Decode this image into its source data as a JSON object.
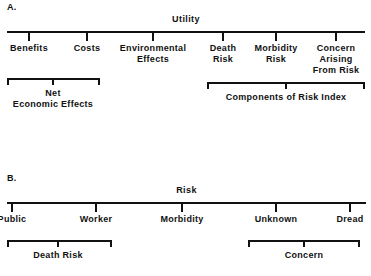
{
  "figure": {
    "background_color": "#ffffff",
    "ink_color": "#111111",
    "panels": [
      {
        "letter": "A.",
        "axis_title": "Utility",
        "axis": {
          "x1": 7,
          "x2": 365,
          "y": 31
        },
        "ticks": [
          {
            "label": "Benefits",
            "x": 29
          },
          {
            "label": "Costs",
            "x": 87
          },
          {
            "label": "Environmental\nEffects",
            "x": 153
          },
          {
            "label": "Death\nRisk",
            "x": 223
          },
          {
            "label": "Morbidity\nRisk",
            "x": 276
          },
          {
            "label": "Concern\nArising\nFrom Risk",
            "x": 336
          }
        ],
        "brackets": [
          {
            "label": "Net\nEconomic Effects",
            "x1": 7,
            "x2": 100,
            "y": 78,
            "stem_x": 53
          },
          {
            "label": "Components of Risk Index",
            "x1": 207,
            "x2": 365,
            "y": 82,
            "stem_x": 286
          }
        ]
      },
      {
        "letter": "B.",
        "axis_title": "Risk",
        "axis": {
          "x1": 7,
          "x2": 366,
          "y": 202
        },
        "ticks": [
          {
            "label": "Public",
            "x": 12
          },
          {
            "label": "Worker",
            "x": 96
          },
          {
            "label": "Morbidity",
            "x": 182
          },
          {
            "label": "Unknown",
            "x": 276
          },
          {
            "label": "Dread",
            "x": 350
          }
        ],
        "brackets": [
          {
            "label": "Death Risk",
            "x1": 7,
            "x2": 112,
            "y": 240,
            "stem_x": 58
          },
          {
            "label": "Concern",
            "x1": 248,
            "x2": 360,
            "y": 240,
            "stem_x": 304
          }
        ]
      }
    ]
  },
  "chart_data": {
    "type": "diagram",
    "panels": [
      {
        "id": "A",
        "label": "A.",
        "root": "Utility",
        "children": [
          "Benefits",
          "Costs",
          "Environmental Effects",
          "Death Risk",
          "Morbidity Risk",
          "Concern Arising From Risk"
        ],
        "groups": [
          {
            "name": "Net Economic Effects",
            "members": [
              "Benefits",
              "Costs"
            ]
          },
          {
            "name": "Components of Risk Index",
            "members": [
              "Death Risk",
              "Morbidity Risk",
              "Concern Arising From Risk"
            ]
          }
        ]
      },
      {
        "id": "B",
        "label": "B.",
        "root": "Risk",
        "children": [
          "Public",
          "Worker",
          "Morbidity",
          "Unknown",
          "Dread"
        ],
        "groups": [
          {
            "name": "Death Risk",
            "members": [
              "Public",
              "Worker"
            ]
          },
          {
            "name": "Concern",
            "members": [
              "Unknown",
              "Dread"
            ]
          }
        ]
      }
    ]
  }
}
